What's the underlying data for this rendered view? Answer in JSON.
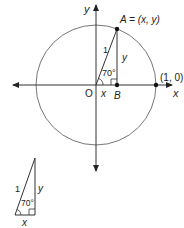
{
  "diagram": {
    "axes": {
      "x_label": "x",
      "y_label": "y",
      "origin_label": "O"
    },
    "unit_circle": {
      "point_A_label": "A = (x, y)",
      "point_B_label": "B",
      "point_unit_label": "(1, 0)",
      "hypotenuse_label": "1",
      "vertical_leg_label": "y",
      "horizontal_leg_label": "x",
      "angle_label": "70°"
    },
    "small_triangle": {
      "hypotenuse_label": "1",
      "vertical_leg_label": "y",
      "horizontal_leg_label": "x",
      "angle_label": "70°"
    },
    "colors": {
      "circle": "#777777",
      "lines": "#333333",
      "points": "#111111"
    }
  }
}
